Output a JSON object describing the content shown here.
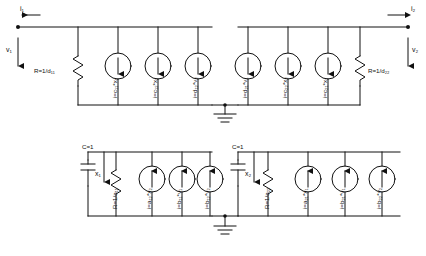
{
  "diagram": {
    "type": "circuit-schematic",
    "ports": {
      "i1": "i₁",
      "i2": "i₂",
      "v1": "v₁",
      "v2": "v₂"
    },
    "top_left_network": {
      "resistor": "R=1/d₁₁",
      "sources": [
        "i=c₁₁*x₁",
        "i=c₁₂*x₂",
        "i=d₁₂*v₂"
      ]
    },
    "top_right_network": {
      "resistor": "R=1/d₂₂",
      "sources": [
        "i=d₂₁*v₁",
        "i=c₂₂*x₂",
        "i=c₂₁*x₁"
      ]
    },
    "bottom_left_network": {
      "capacitor": "C=1",
      "node": "x₁",
      "resistor": "R=1/a₁₁",
      "sources": [
        "i=a₁₂*x₂",
        "i=b₁₁*v₁",
        "i=b₁₂*v₂"
      ]
    },
    "bottom_right_network": {
      "capacitor": "C=1",
      "node": "x₂",
      "resistor": "R=1/a₂₂",
      "sources": [
        "i=a₂₁*x₁",
        "i=b₂₁*v₁",
        "i=b₂₂*v₂"
      ]
    },
    "colors": {
      "line": "#111111",
      "background": "#ffffff"
    }
  }
}
